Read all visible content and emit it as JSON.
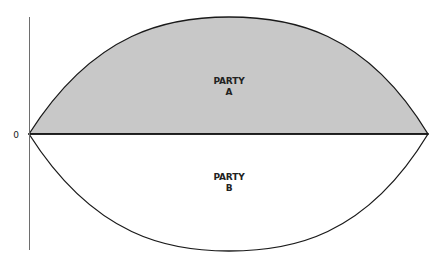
{
  "diagram": {
    "type": "lens-diagram",
    "axis": {
      "origin_label": "0"
    },
    "regions": [
      {
        "id": "party-a",
        "label_line1": "PARTY",
        "label_line2": "A",
        "position": "above-baseline",
        "fill": "#c8c8c8"
      },
      {
        "id": "party-b",
        "label_line1": "PARTY",
        "label_line2": "B",
        "position": "below-baseline",
        "fill": "#ffffff"
      }
    ],
    "colors": {
      "stroke": "#1a1a1a",
      "axis": "#6e6e6e",
      "party_a_fill": "#c8c8c8",
      "party_b_fill": "#ffffff",
      "background": "#ffffff"
    }
  }
}
